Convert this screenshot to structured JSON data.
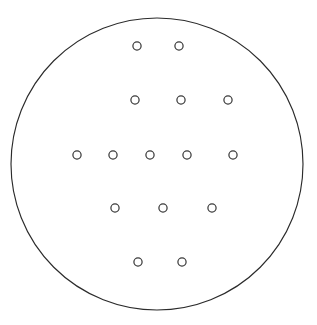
{
  "figure": {
    "background_color": "#ffffff",
    "width": 317,
    "height": 325
  },
  "boundary": {
    "shape_name": "circle",
    "center_x": 157,
    "center_y": 164,
    "radius": 146,
    "stroke_color": "#2b2b2b",
    "stroke_width": 1.15,
    "fill": "none"
  },
  "markers": {
    "glyph": "o",
    "shape_name": "ring",
    "count": 15,
    "radius": 4.1,
    "stroke_color": "#3a3a3a",
    "stroke_width": 1.25,
    "fill": "none",
    "rows": [
      {
        "row_index": 1,
        "count": 2,
        "y": 46,
        "points": [
          {
            "x": 137,
            "y": 46
          },
          {
            "x": 179,
            "y": 46
          }
        ]
      },
      {
        "row_index": 2,
        "count": 3,
        "y": 100,
        "points": [
          {
            "x": 135,
            "y": 100
          },
          {
            "x": 181,
            "y": 100
          },
          {
            "x": 228,
            "y": 100
          }
        ]
      },
      {
        "row_index": 3,
        "count": 5,
        "y": 155,
        "points": [
          {
            "x": 77,
            "y": 155
          },
          {
            "x": 113,
            "y": 155
          },
          {
            "x": 150,
            "y": 155
          },
          {
            "x": 187,
            "y": 155
          },
          {
            "x": 233,
            "y": 155
          }
        ]
      },
      {
        "row_index": 4,
        "count": 3,
        "y": 208,
        "points": [
          {
            "x": 115,
            "y": 208
          },
          {
            "x": 163,
            "y": 208
          },
          {
            "x": 212,
            "y": 208
          }
        ]
      },
      {
        "row_index": 5,
        "count": 2,
        "y": 262,
        "points": [
          {
            "x": 138,
            "y": 262
          },
          {
            "x": 182,
            "y": 262
          }
        ]
      }
    ]
  }
}
